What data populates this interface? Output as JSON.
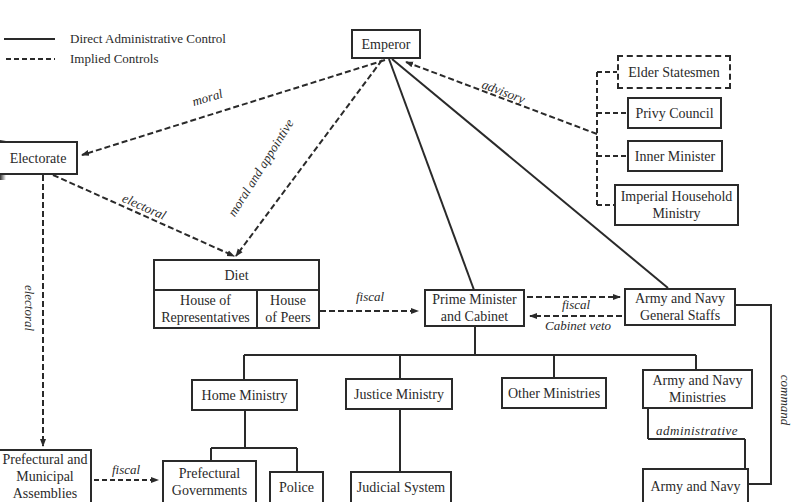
{
  "legend": {
    "solid_label": "Direct Administrative Control",
    "dashed_label": "Implied Controls"
  },
  "nodes": {
    "emperor": "Emperor",
    "electorate": "Electorate",
    "elder_statesmen": "Elder Statesmen",
    "privy_council": "Privy Council",
    "inner_minister": "Inner Minister",
    "imperial_household": "Imperial Household Ministry",
    "diet": "Diet",
    "house_of_representatives": "House of Representatives",
    "house_of_peers": "House of Peers",
    "prime_minister": "Prime Minister and Cabinet",
    "general_staffs": "Army and Navy General Staffs",
    "home_ministry": "Home Ministry",
    "justice_ministry": "Justice Ministry",
    "other_ministries": "Other Ministries",
    "army_navy_ministries": "Army and Navy Ministries",
    "prefectural_assemblies": "Prefectural and Municipal Assemblies",
    "prefectural_governments": "Prefectural Governments",
    "police": "Police",
    "judicial_system": "Judicial System",
    "army_and_navy": "Army and Navy"
  },
  "edge_labels": {
    "moral": "moral",
    "moral_appointive": "moral and appointive",
    "advisory": "advisory",
    "electoral_diag": "electoral",
    "electoral_vert": "electoral",
    "fiscal_diet": "fiscal",
    "fiscal_staffs": "fiscal",
    "cabinet_veto": "Cabinet veto",
    "administrative": "administrative",
    "command": "command",
    "fiscal_assemblies": "fiscal"
  },
  "colors": {
    "ink": "#2a2a2a",
    "background": "#ffffff"
  }
}
